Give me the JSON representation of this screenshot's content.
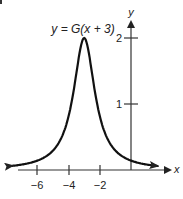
{
  "chart_data": {
    "type": "line",
    "title": "y = G(x + 3)",
    "xlabel": "x",
    "ylabel": "y",
    "x_ticks": [
      -6,
      -4,
      -2
    ],
    "x_tick_labels": [
      "−6",
      "−4",
      "−2"
    ],
    "y_ticks": [
      1,
      2
    ],
    "y_tick_labels": [
      "1",
      "2"
    ],
    "xlim": [
      -8.5,
      2.6
    ],
    "ylim": [
      0,
      2.4
    ],
    "grid": false,
    "legend": "none",
    "series": [
      {
        "name": "y = G(x + 3)",
        "peak": {
          "x": -3,
          "y": 2
        },
        "x": [
          -7.5,
          -7,
          -6,
          -5,
          -4.5,
          -4,
          -3.5,
          -3,
          -2.5,
          -2,
          -1.5,
          -1,
          0,
          1
        ],
        "y": [
          0.06,
          0.08,
          0.14,
          0.29,
          0.47,
          0.82,
          1.47,
          2.0,
          1.47,
          0.82,
          0.47,
          0.29,
          0.14,
          0.08
        ],
        "end_arrows": true
      }
    ]
  },
  "labels": {
    "curve_label": "y = G(x + 3)",
    "x_axis": "x",
    "y_axis": "y",
    "x_ticks": [
      "−6",
      "−4",
      "−2"
    ],
    "y_ticks": [
      "1",
      "2"
    ]
  }
}
